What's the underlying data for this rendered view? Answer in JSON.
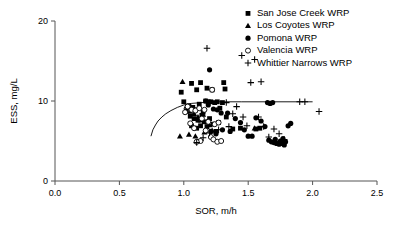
{
  "chart_data": {
    "type": "scatter",
    "title": "",
    "xlabel": "SOR, m/h",
    "ylabel": "ESS, mg/L",
    "xlim": [
      0.0,
      2.5
    ],
    "ylim": [
      0,
      20
    ],
    "xticks": [
      "0.0",
      "0.5",
      "1.0",
      "1.5",
      "2.0",
      "2.5"
    ],
    "xtick_values": [
      0.0,
      0.5,
      1.0,
      1.5,
      2.0,
      2.5
    ],
    "yticks": [
      "0",
      "10",
      "20"
    ],
    "ytick_values": [
      0,
      10,
      20
    ],
    "grid": false,
    "legend_position": "top-right",
    "marker_color": "#000000",
    "series": [
      {
        "name": "San Jose Creek WRP",
        "marker": "filled-square",
        "points": [
          [
            0.98,
            11.1
          ],
          [
            1.06,
            12.2
          ],
          [
            1.1,
            11.4
          ],
          [
            1.13,
            12.3
          ],
          [
            1.18,
            11.6
          ],
          [
            1.22,
            11.4
          ],
          [
            1.31,
            12.3
          ],
          [
            1.32,
            11.5
          ],
          [
            1.0,
            9.9
          ],
          [
            1.04,
            9.4
          ],
          [
            1.07,
            9.2
          ],
          [
            1.09,
            8.9
          ],
          [
            1.12,
            9.6
          ],
          [
            1.15,
            8.6
          ],
          [
            1.17,
            10.0
          ],
          [
            1.19,
            9.9
          ],
          [
            1.21,
            9.9
          ],
          [
            1.24,
            9.8
          ],
          [
            1.26,
            9.9
          ],
          [
            1.28,
            9.1
          ],
          [
            1.3,
            9.8
          ],
          [
            1.05,
            8.1
          ],
          [
            1.08,
            7.8
          ],
          [
            1.11,
            7.6
          ],
          [
            1.14,
            8.2
          ],
          [
            1.16,
            7.4
          ],
          [
            1.2,
            7.8
          ],
          [
            1.23,
            7.1
          ],
          [
            1.27,
            7.3
          ],
          [
            1.33,
            8.0
          ],
          [
            1.38,
            6.5
          ],
          [
            1.44,
            6.6
          ],
          [
            1.56,
            6.5
          ],
          [
            1.59,
            6.6
          ],
          [
            1.06,
            6.9
          ],
          [
            1.1,
            6.6
          ],
          [
            1.13,
            6.9
          ],
          [
            1.18,
            6.8
          ],
          [
            1.25,
            6.2
          ],
          [
            1.02,
            8.7
          ]
        ]
      },
      {
        "name": "Los Coyotes WRP",
        "marker": "filled-triangle",
        "points": [
          [
            0.99,
            12.4
          ],
          [
            1.02,
            9.3
          ],
          [
            1.05,
            8.7
          ],
          [
            1.08,
            8.4
          ],
          [
            1.11,
            8.0
          ],
          [
            1.13,
            7.6
          ],
          [
            1.15,
            8.3
          ],
          [
            1.18,
            7.4
          ],
          [
            1.2,
            7.0
          ],
          [
            1.04,
            5.8
          ],
          [
            1.09,
            5.6
          ],
          [
            0.97,
            5.6
          ],
          [
            1.16,
            6.1
          ],
          [
            1.22,
            6.3
          ],
          [
            1.55,
            6.6
          ]
        ]
      },
      {
        "name": "Pomona WRP",
        "marker": "filled-circle",
        "points": [
          [
            1.2,
            13.9
          ],
          [
            1.17,
            10.0
          ],
          [
            1.19,
            9.5
          ],
          [
            1.23,
            9.0
          ],
          [
            1.26,
            8.9
          ],
          [
            1.29,
            8.5
          ],
          [
            1.34,
            8.5
          ],
          [
            1.4,
            7.8
          ],
          [
            1.44,
            7.3
          ],
          [
            1.47,
            6.4
          ],
          [
            1.5,
            5.6
          ],
          [
            1.53,
            5.6
          ],
          [
            1.56,
            7.9
          ],
          [
            1.6,
            7.5
          ],
          [
            1.65,
            9.8
          ],
          [
            1.67,
            9.7
          ],
          [
            1.69,
            9.8
          ],
          [
            1.63,
            6.8
          ],
          [
            1.66,
            5.1
          ],
          [
            1.68,
            4.9
          ],
          [
            1.7,
            4.8
          ],
          [
            1.71,
            5.2
          ],
          [
            1.72,
            4.7
          ],
          [
            1.74,
            4.6
          ],
          [
            1.75,
            5.0
          ],
          [
            1.76,
            4.7
          ],
          [
            1.77,
            5.3
          ],
          [
            1.78,
            4.5
          ],
          [
            1.79,
            4.9
          ],
          [
            1.81,
            6.9
          ],
          [
            1.83,
            7.2
          ],
          [
            1.36,
            6.2
          ],
          [
            1.3,
            6.4
          ],
          [
            1.25,
            5.9
          ],
          [
            1.21,
            6.2
          ]
        ]
      },
      {
        "name": "Valencia WRP",
        "marker": "open-circle",
        "points": [
          [
            1.22,
            11.4
          ],
          [
            1.03,
            9.3
          ],
          [
            1.06,
            8.9
          ],
          [
            1.01,
            8.6
          ],
          [
            1.09,
            8.8
          ],
          [
            1.12,
            9.1
          ],
          [
            1.16,
            8.9
          ],
          [
            1.14,
            7.8
          ],
          [
            1.19,
            7.4
          ],
          [
            1.24,
            7.1
          ],
          [
            1.27,
            7.3
          ],
          [
            1.08,
            6.6
          ],
          [
            1.17,
            6.3
          ],
          [
            1.21,
            5.5
          ],
          [
            1.23,
            5.2
          ],
          [
            1.13,
            5.0
          ],
          [
            1.1,
            4.9
          ],
          [
            1.26,
            4.9
          ],
          [
            1.29,
            5.0
          ],
          [
            1.05,
            7.2
          ]
        ]
      },
      {
        "name": "Whittier Narrows WRP",
        "marker": "plus",
        "points": [
          [
            1.18,
            16.6
          ],
          [
            1.45,
            15.7
          ],
          [
            1.55,
            15.2
          ],
          [
            1.52,
            12.3
          ],
          [
            1.6,
            12.4
          ],
          [
            1.41,
            9.3
          ],
          [
            1.9,
            9.9
          ],
          [
            1.94,
            9.9
          ],
          [
            2.05,
            8.7
          ],
          [
            1.46,
            8.0
          ],
          [
            1.38,
            8.4
          ],
          [
            1.58,
            8.0
          ],
          [
            1.33,
            9.8
          ],
          [
            1.62,
            6.8
          ],
          [
            1.7,
            6.5
          ],
          [
            1.74,
            5.9
          ],
          [
            1.66,
            5.5
          ],
          [
            1.78,
            5.2
          ],
          [
            1.1,
            4.8
          ],
          [
            1.15,
            5.4
          ],
          [
            1.2,
            6.0
          ],
          [
            1.27,
            6.4
          ],
          [
            1.35,
            6.8
          ],
          [
            1.49,
            6.9
          ]
        ]
      }
    ],
    "fit_curve": {
      "name": "fitted-trend-curve",
      "description": "rising curve flattening to asymptote near ESS 10",
      "points": [
        [
          0.745,
          5.6
        ],
        [
          0.76,
          6.4
        ],
        [
          0.78,
          7.0
        ],
        [
          0.8,
          7.5
        ],
        [
          0.83,
          8.0
        ],
        [
          0.86,
          8.4
        ],
        [
          0.9,
          8.8
        ],
        [
          0.95,
          9.2
        ],
        [
          1.0,
          9.5
        ],
        [
          1.06,
          9.7
        ],
        [
          1.14,
          9.8
        ],
        [
          1.25,
          9.9
        ],
        [
          1.45,
          9.9
        ],
        [
          1.7,
          9.9
        ],
        [
          1.95,
          9.9
        ]
      ]
    }
  },
  "legend": {
    "items": [
      {
        "label": "San Jose Creek WRP",
        "marker": "filled-square"
      },
      {
        "label": "Los Coyotes WRP",
        "marker": "filled-triangle"
      },
      {
        "label": "Pomona WRP",
        "marker": "filled-circle"
      },
      {
        "label": "Valencia WRP",
        "marker": "open-circle"
      },
      {
        "label": "Whittier Narrows WRP",
        "marker": "plus"
      }
    ]
  }
}
